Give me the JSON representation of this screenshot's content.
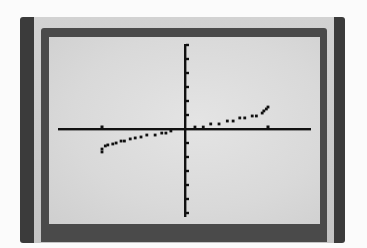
{
  "chart_data": {
    "type": "scatter",
    "title": "",
    "xlabel": "",
    "ylabel": "",
    "grid": false,
    "legend": null,
    "mode": "dot",
    "x_tick_step": 1,
    "y_tick_step": 1,
    "xlim": [
      -1.53,
      1.52
    ],
    "ylim": [
      -6.3,
      6.0
    ],
    "x_ticks": [
      -1,
      1
    ],
    "y_ticks": [
      -6,
      -5,
      -4,
      -3,
      -2,
      -1,
      1,
      2,
      3,
      4,
      5,
      6
    ],
    "series": [
      {
        "name": "plot1",
        "x": [
          -1.0,
          -1.0,
          -0.96,
          -0.93,
          -0.87,
          -0.83,
          -0.77,
          -0.73,
          -0.66,
          -0.6,
          -0.53,
          -0.46,
          -0.36,
          -0.28,
          -0.23,
          -0.17,
          0.12,
          0.22,
          0.31,
          0.41,
          0.51,
          0.58,
          0.66,
          0.72,
          0.81,
          0.86,
          0.93,
          0.95,
          0.98,
          1.0
        ],
        "y": [
          -1.64,
          -1.43,
          -1.21,
          -1.14,
          -1.07,
          -1.0,
          -0.86,
          -0.86,
          -0.71,
          -0.64,
          -0.57,
          -0.43,
          -0.43,
          -0.29,
          -0.29,
          -0.14,
          0.14,
          0.14,
          0.36,
          0.36,
          0.57,
          0.57,
          0.79,
          0.79,
          0.93,
          0.93,
          1.14,
          1.29,
          1.43,
          1.57
        ]
      }
    ],
    "axis_pixels": {
      "origin": [
        136,
        92
      ],
      "x_unit_px": 83,
      "y_unit_px": 14,
      "x_extent": [
        9,
        262
      ],
      "y_extent": [
        7,
        180
      ]
    }
  },
  "device": {
    "screen": "graphing-calculator-lcd",
    "colors": {
      "bezel_dark": "#3b3b3b",
      "bezel_band": "#cacaca",
      "bezel_inner": "#4a4a4a",
      "lcd_background": "#dcdcdc",
      "ink": "#111111"
    }
  }
}
